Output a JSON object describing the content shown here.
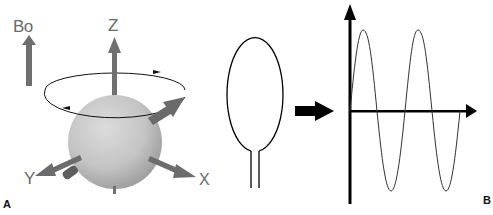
{
  "figure": {
    "panel_a": {
      "panel_label": "A",
      "field_label": "Bo",
      "axes": {
        "z_label": "Z",
        "y_label": "Y",
        "x_label": "X"
      },
      "description": "Spinning proton sphere precessing about the Z axis in external magnetic field Bo"
    },
    "coil": {
      "description": "Receiver coil loop with two leads"
    },
    "transition_arrow": {
      "description": "Block arrow pointing from coil to signal plot"
    },
    "panel_b": {
      "panel_label": "B",
      "description": "Induced sinusoidal signal plotted on vertical and horizontal axes",
      "wave": {
        "type": "sine",
        "cycles_visible": 2,
        "start_phase": "rising from zero"
      }
    }
  },
  "colors": {
    "arrow_gray": "#707070",
    "sphere_light": "#d8d8d8",
    "sphere_dark": "#9a9a9a",
    "line_black": "#000000",
    "label_gray": "#6a6a6a"
  }
}
